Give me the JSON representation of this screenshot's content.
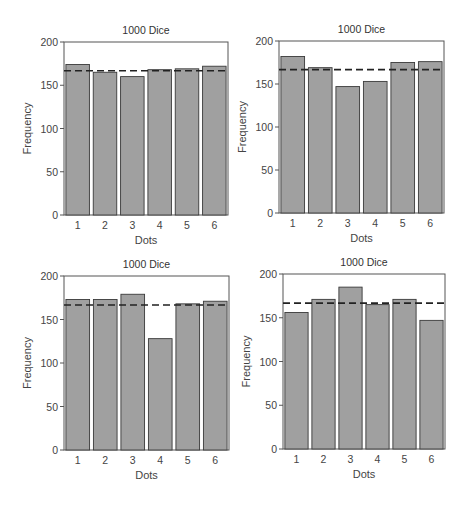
{
  "chart_data": [
    {
      "type": "bar",
      "title": "1000 Dice",
      "xlabel": "Dots",
      "ylabel": "Frequency",
      "categories": [
        "1",
        "2",
        "3",
        "4",
        "5",
        "6"
      ],
      "values": [
        174,
        165,
        160,
        168,
        169,
        172
      ],
      "ylim": [
        0,
        200
      ],
      "yticks": [
        "0",
        "50",
        "100",
        "150",
        "200"
      ],
      "reference_line": {
        "style": "dashed",
        "value": 166.7
      },
      "grid": false,
      "legend": null
    },
    {
      "type": "bar",
      "title": "1000 Dice",
      "xlabel": "Dots",
      "ylabel": "Frequency",
      "categories": [
        "1",
        "2",
        "3",
        "4",
        "5",
        "6"
      ],
      "values": [
        182,
        169,
        147,
        153,
        175,
        176
      ],
      "ylim": [
        0,
        200
      ],
      "yticks": [
        "0",
        "50",
        "100",
        "150",
        "200"
      ],
      "reference_line": {
        "style": "dashed",
        "value": 166.7
      },
      "grid": false,
      "legend": null
    },
    {
      "type": "bar",
      "title": "1000 Dice",
      "xlabel": "Dots",
      "ylabel": "Frequency",
      "categories": [
        "1",
        "2",
        "3",
        "4",
        "5",
        "6"
      ],
      "values": [
        173,
        173,
        179,
        128,
        168,
        171
      ],
      "ylim": [
        0,
        200
      ],
      "yticks": [
        "0",
        "50",
        "100",
        "150",
        "200"
      ],
      "reference_line": {
        "style": "dashed",
        "value": 166.7
      },
      "grid": false,
      "legend": null
    },
    {
      "type": "bar",
      "title": "1000 Dice",
      "xlabel": "Dots",
      "ylabel": "Frequency",
      "categories": [
        "1",
        "2",
        "3",
        "4",
        "5",
        "6"
      ],
      "values": [
        156,
        171,
        185,
        165,
        171,
        147
      ],
      "ylim": [
        0,
        200
      ],
      "yticks": [
        "0",
        "50",
        "100",
        "150",
        "200"
      ],
      "reference_line": {
        "style": "dashed",
        "value": 166.7
      },
      "grid": false,
      "legend": null
    }
  ],
  "colors": {
    "bar_fill": "#a0a0a0",
    "bar_stroke": "#3a3a3a",
    "axis": "#555555",
    "dashed_line": "#222222"
  },
  "layout": [
    {
      "left": 0,
      "top": 0
    },
    {
      "left": 234,
      "top": 0
    },
    {
      "left": 0,
      "top": 250
    },
    {
      "left": 234,
      "top": 250
    }
  ]
}
